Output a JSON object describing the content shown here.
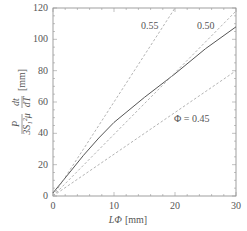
{
  "chart_data": {
    "type": "line",
    "title": "",
    "xlabel": "LΦ [mm]",
    "ylabel": "P/(3S₁²μ) · dt/dT [mm]",
    "xlim": [
      0,
      30
    ],
    "ylim": [
      0,
      120
    ],
    "xticks": [
      0,
      10,
      20,
      30
    ],
    "yticks": [
      0,
      20,
      40,
      60,
      80,
      100,
      120
    ],
    "grid": false,
    "legend": null,
    "series": [
      {
        "name": "measured",
        "style": "solid",
        "x": [
          0,
          2.5,
          5,
          7.5,
          10,
          15,
          20,
          25,
          30
        ],
        "y": [
          2,
          14,
          26,
          37,
          47,
          63,
          78,
          94,
          108
        ]
      },
      {
        "name": "Φ = 0.55",
        "style": "dashed",
        "x": [
          0,
          20
        ],
        "y": [
          0,
          120
        ]
      },
      {
        "name": "Φ = 0.50",
        "style": "dashed",
        "x": [
          0,
          30
        ],
        "y": [
          0,
          118
        ]
      },
      {
        "name": "Φ = 0.45",
        "style": "dashed",
        "x": [
          0,
          30
        ],
        "y": [
          0,
          80
        ]
      }
    ],
    "annotations": [
      {
        "text": "0.55",
        "x": 16,
        "y": 112
      },
      {
        "text": "0.50",
        "x": 25.5,
        "y": 112
      },
      {
        "text": "Φ = 0.45",
        "x": 21,
        "y": 53
      }
    ]
  },
  "labels": {
    "xlabel_var": "LΦ",
    "xlabel_unit": "[mm]",
    "ylabel_num1": "P",
    "ylabel_den1": "3S₁²μ",
    "ylabel_num2": "dt",
    "ylabel_den2": "dT",
    "ylabel_unit": "[mm]",
    "ann_055": "0.55",
    "ann_050": "0.50",
    "ann_045": "Φ = 0.45",
    "xt0": "0",
    "xt1": "10",
    "xt2": "20",
    "xt3": "30",
    "yt0": "0",
    "yt1": "20",
    "yt2": "40",
    "yt3": "60",
    "yt4": "80",
    "yt5": "100",
    "yt6": "120"
  }
}
